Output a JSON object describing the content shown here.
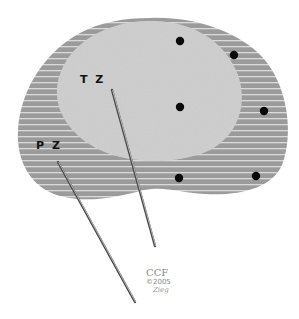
{
  "diagram": {
    "zones": [
      {
        "id": "pz",
        "label": "P Z",
        "color": "#9a9a9a",
        "pattern": "horizontal-stripes",
        "stripe_color": "#d8d8d8"
      },
      {
        "id": "tz",
        "label": "T Z",
        "color": "#cfcfcf",
        "pattern": "speckled"
      }
    ],
    "dots": [
      {
        "x": 180,
        "y": 41
      },
      {
        "x": 234,
        "y": 55
      },
      {
        "x": 180,
        "y": 107
      },
      {
        "x": 264,
        "y": 111
      },
      {
        "x": 179,
        "y": 178
      },
      {
        "x": 256,
        "y": 176
      }
    ],
    "needles": [
      {
        "id": "needle-tz",
        "x1": 112,
        "y1": 90,
        "x2": 155,
        "y2": 246
      },
      {
        "id": "needle-pz",
        "x1": 58,
        "y1": 162,
        "x2": 135,
        "y2": 302
      }
    ],
    "logo": {
      "text": "CCF",
      "copyright": "©2005",
      "signature": "Zieg"
    }
  }
}
